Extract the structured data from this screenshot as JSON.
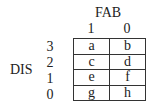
{
  "column_variable": "FAB",
  "row_variable": "DIS",
  "column_levels": [
    "1",
    "0"
  ],
  "row_levels": [
    "3",
    "2",
    "1",
    "0"
  ],
  "cells": [
    [
      "a",
      "b"
    ],
    [
      "c",
      "d"
    ],
    [
      "e",
      "f"
    ],
    [
      "g",
      "h"
    ]
  ]
}
